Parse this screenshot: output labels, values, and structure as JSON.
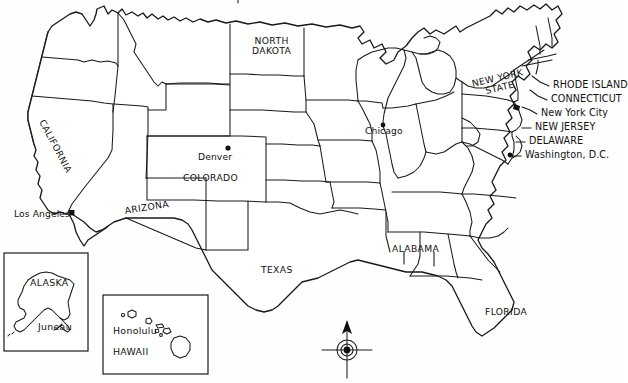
{
  "map": {
    "title_cropped": "",
    "background_color": "#fefefe",
    "line_color": "#1a1a1a",
    "state_labels": [
      {
        "id": "north-dakota",
        "text": "NORTH\nDAKOTA",
        "line1": "NORTH",
        "line2": "DAKOTA",
        "x": 252,
        "y": 41
      },
      {
        "id": "california",
        "text": "CALIFORNIA",
        "x": 46,
        "y": 118
      },
      {
        "id": "colorado",
        "text": "COLORADO",
        "x": 183,
        "y": 173
      },
      {
        "id": "arizona",
        "text": "ARIZONA",
        "x": 124,
        "y": 206
      },
      {
        "id": "texas",
        "text": "TEXAS",
        "x": 261,
        "y": 265
      },
      {
        "id": "alabama",
        "text": "ALABAMA",
        "x": 392,
        "y": 244
      },
      {
        "id": "florida",
        "text": "FLORIDA",
        "x": 485,
        "y": 312
      },
      {
        "id": "new-york-state",
        "line1": "NEW YORK",
        "line2": "STATE",
        "text": "NEW YORK STATE",
        "x": 471,
        "y": 79
      }
    ],
    "city_labels": [
      {
        "id": "denver",
        "text": "Denver",
        "x": 198,
        "y": 157,
        "dot_x": 228,
        "dot_y": 148
      },
      {
        "id": "los-angeles",
        "text": "Los Angeles",
        "x": 14,
        "y": 214,
        "dot_x": 72,
        "dot_y": 214
      },
      {
        "id": "chicago",
        "text": "Chicago",
        "x": 365,
        "y": 129,
        "dot_x": 383,
        "dot_y": 125
      }
    ],
    "callouts": [
      {
        "id": "rhode-island",
        "text": "RHODE ISLAND",
        "x": 553,
        "y": 86
      },
      {
        "id": "connecticut",
        "text": "CONNECTICUT",
        "x": 551,
        "y": 100
      },
      {
        "id": "new-york-city",
        "text": "New York City",
        "x": 541,
        "y": 114
      },
      {
        "id": "new-jersey",
        "text": "NEW JERSEY",
        "x": 535,
        "y": 128
      },
      {
        "id": "delaware",
        "text": "DELAWARE",
        "x": 529,
        "y": 142
      },
      {
        "id": "washington-dc",
        "text": "Washington, D.C.",
        "x": 525,
        "y": 156
      }
    ],
    "insets": [
      {
        "id": "alaska-inset",
        "state_label": "ALASKA",
        "state_label_x": 30,
        "state_label_y": 283,
        "city_label": "Juneau",
        "city_label_x": 38,
        "city_label_y": 327,
        "box": {
          "x": 4,
          "y": 253,
          "w": 84,
          "h": 98
        }
      },
      {
        "id": "hawaii-inset",
        "state_label": "HAWAII",
        "state_label_x": 113,
        "state_label_y": 352,
        "city_label": "Honolulu",
        "city_label_x": 113,
        "city_label_y": 331,
        "box": {
          "x": 103,
          "y": 295,
          "w": 105,
          "h": 79
        }
      }
    ],
    "compass": {
      "id": "compass-rose",
      "x": 347,
      "y": 350,
      "direction": "north"
    }
  }
}
